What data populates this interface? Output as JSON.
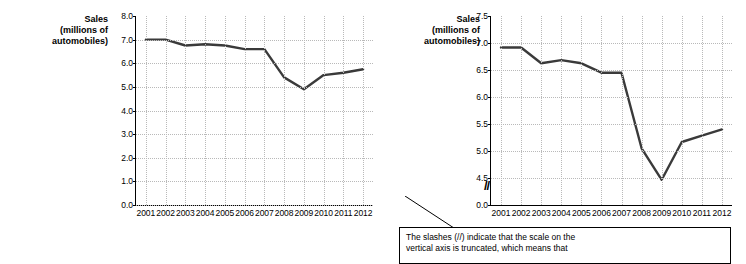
{
  "chart_data": [
    {
      "id": "left",
      "type": "line",
      "title": "",
      "ylabel": "Sales (millions of automobiles)",
      "xlabel": "",
      "categories": [
        "2001",
        "2002",
        "2003",
        "2004",
        "2005",
        "2006",
        "2007",
        "2008",
        "2009",
        "2010",
        "2011",
        "2012"
      ],
      "values": [
        7.0,
        7.0,
        6.75,
        6.8,
        6.75,
        6.6,
        6.6,
        5.4,
        4.9,
        5.5,
        5.6,
        5.75
      ],
      "yticks": [
        "0.0",
        "1.0",
        "2.0",
        "3.0",
        "4.0",
        "5.0",
        "6.0",
        "7.0",
        "8.0"
      ],
      "ylim": [
        0.0,
        8.0
      ],
      "grid": true,
      "legend": "none",
      "truncated_axis": false
    },
    {
      "id": "right",
      "type": "line",
      "title": "",
      "ylabel": "Sales (millions of automobiles)",
      "xlabel": "",
      "categories": [
        "2001",
        "2002",
        "2003",
        "2004",
        "2005",
        "2006",
        "2007",
        "2008",
        "2009",
        "2010",
        "2011",
        "2012"
      ],
      "values": [
        7.0,
        7.0,
        6.75,
        6.8,
        6.75,
        6.6,
        6.6,
        5.4,
        4.9,
        5.5,
        5.6,
        5.7
      ],
      "yticks": [
        "0.0",
        "4.5",
        "5.0",
        "5.5",
        "6.0",
        "6.5",
        "7.0",
        "7.5"
      ],
      "ylim": [
        4.5,
        7.5
      ],
      "grid": true,
      "legend": "none",
      "truncated_axis": true,
      "truncation_mark": "//"
    }
  ],
  "axis_titles": {
    "sales": "Sales",
    "millions_of": "(millions of",
    "automobiles": "automobiles)"
  },
  "callout": {
    "line1": "The slashes (//) indicate that the scale on the",
    "line2": "vertical axis is truncated, which means that"
  }
}
